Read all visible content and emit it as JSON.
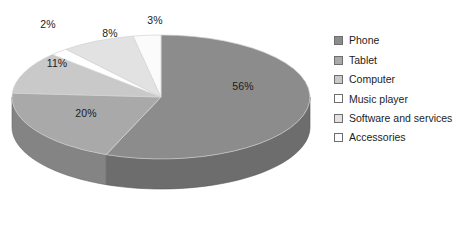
{
  "chart_data": {
    "type": "pie",
    "title": "",
    "subtitle": "",
    "xlabel": "",
    "ylabel": "",
    "grid": false,
    "three_d": true,
    "legend_position": "right",
    "categories": [
      "Phone",
      "Tablet",
      "Computer",
      "Music player",
      "Software and services",
      "Accessories"
    ],
    "values": [
      56,
      20,
      11,
      2,
      8,
      3
    ],
    "value_labels": [
      "56%",
      "20%",
      "11%",
      "2%",
      "8%",
      "3%"
    ],
    "unit": "%",
    "colors": [
      "#8c8c8c",
      "#a9a9a9",
      "#c9c9c9",
      "#ffffff",
      "#e2e2e2",
      "#fbfbfb"
    ],
    "slices": [
      {
        "label": "Phone",
        "value": 56,
        "value_label": "56%",
        "color": "#8c8c8c",
        "label_x": 243,
        "label_y": 86
      },
      {
        "label": "Tablet",
        "value": 20,
        "value_label": "20%",
        "color": "#a9a9a9",
        "label_x": 86,
        "label_y": 113
      },
      {
        "label": "Computer",
        "value": 11,
        "value_label": "11%",
        "color": "#c9c9c9",
        "label_x": 57,
        "label_y": 63
      },
      {
        "label": "Music player",
        "value": 2,
        "value_label": "2%",
        "color": "#ffffff",
        "label_x": 48,
        "label_y": 24
      },
      {
        "label": "Software and services",
        "value": 8,
        "value_label": "8%",
        "color": "#e2e2e2",
        "label_x": 110,
        "label_y": 33
      },
      {
        "label": "Accessories",
        "value": 3,
        "value_label": "3%",
        "color": "#fbfbfb",
        "label_x": 155,
        "label_y": 20
      }
    ]
  },
  "legend": {
    "items": [
      {
        "label": "Phone",
        "color": "#8c8c8c"
      },
      {
        "label": "Tablet",
        "color": "#a9a9a9"
      },
      {
        "label": "Computer",
        "color": "#c9c9c9"
      },
      {
        "label": "Music player",
        "color": "#ffffff"
      },
      {
        "label": "Software and services",
        "color": "#e2e2e2"
      },
      {
        "label": "Accessories",
        "color": "#fbfbfb"
      }
    ]
  }
}
